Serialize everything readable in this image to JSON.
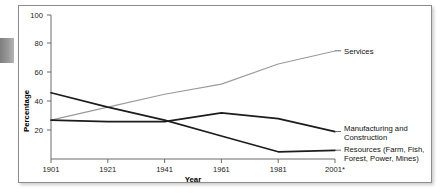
{
  "figure": {
    "page_tab_color": "#8e8e8e",
    "frame_border_color": "#8c8c8c",
    "background_color": "#ffffff"
  },
  "chart_data": {
    "type": "line",
    "title": "",
    "xlabel": "Year",
    "ylabel": "Percentage",
    "x": [
      1901,
      1921,
      1941,
      1961,
      1981,
      2001
    ],
    "xtick_labels": [
      "1901",
      "1921",
      "1941",
      "1961",
      "1981",
      "2001*"
    ],
    "xlim": [
      1901,
      2001
    ],
    "ylim": [
      0,
      100
    ],
    "ytick_labels": [
      "20",
      "40",
      "60",
      "80",
      "100"
    ],
    "yticks": [
      20,
      40,
      60,
      80,
      100
    ],
    "grid": false,
    "legend": "right-of-plot-inline-labels",
    "series": [
      {
        "name": "Services",
        "label": "Services",
        "color": "#9a9a9a",
        "style": "light",
        "values": [
          27,
          36,
          45,
          52,
          66,
          75
        ]
      },
      {
        "name": "Manufacturing and Construction",
        "label": "Manufacturing and\nConstruction",
        "label_line1": "Manufacturing and",
        "label_line2": "Construction",
        "color": "#1c1c1c",
        "style": "dark",
        "values": [
          27,
          26,
          26,
          32,
          28,
          19
        ]
      },
      {
        "name": "Resources (Farm, Fish, Forest, Power, Mines)",
        "label": "Resources (Farm, Fish,\nForest, Power, Mines)",
        "label_line1": "Resources (Farm, Fish,",
        "label_line2": "Forest, Power, Mines)",
        "color": "#1c1c1c",
        "style": "dark",
        "values": [
          46,
          36,
          27,
          16,
          5,
          6
        ]
      }
    ]
  }
}
